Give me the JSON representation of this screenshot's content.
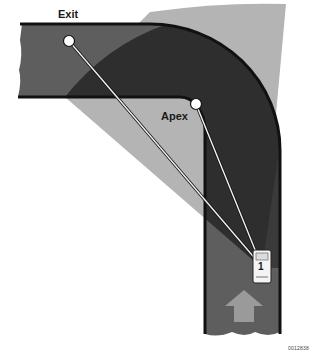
{
  "diagram": {
    "type": "road-cornering-line",
    "labels": {
      "exit": "Exit",
      "apex": "Apex",
      "car_number": "1",
      "figure_code": "0012838"
    },
    "colors": {
      "road": "#5e5e5e",
      "road_edge": "#111111",
      "view_cone_dark": "#2e2e2e",
      "view_cone_light": "#b4b4b4",
      "sight_line": "#f2f2f2",
      "arrow": "#9a9a9a",
      "marker": "#ffffff"
    },
    "points": {
      "exit_marker": [
        69,
        41
      ],
      "apex_marker": [
        196,
        104
      ],
      "car": [
        262,
        268
      ]
    },
    "elements": [
      "horizontal road segment (exit)",
      "vertical road segment (approach)",
      "90-degree curve",
      "light gray field-of-view wedge from car",
      "dark gray field-of-view on road",
      "sight lines from car to apex and exit",
      "direction-of-travel arrow",
      "car labeled 1"
    ]
  }
}
